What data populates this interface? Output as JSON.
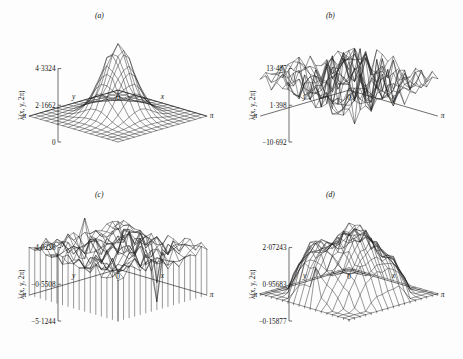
{
  "figure": {
    "background_color": "#fdfdfd",
    "line_color": "#1b1b1b",
    "panel_count": 4
  },
  "axis_common": {
    "vertical_label": "λ(x, y, 2π)",
    "x_axis_label": "x",
    "y_axis_label": "y",
    "origin_label": "0",
    "x_max_label": "π",
    "y_max_label": "π",
    "grid_divisions": 16
  },
  "panels": [
    {
      "tag": "(a)",
      "position": "top-left",
      "vertical_label": "λ(x, y, 2π)",
      "ticks": [
        "4·3324",
        "2·1662",
        "0"
      ],
      "x_label": "x",
      "y_label": "y",
      "origin_label": "0",
      "x_max_label": "π",
      "y_max_label": "π",
      "surface_description": "single smooth central peak with sharp narrow spikes at apex"
    },
    {
      "tag": "(b)",
      "position": "top-right",
      "vertical_label": "λ(x, y, 2π)",
      "ticks": [
        "13·487",
        "1·398",
        "−10·692"
      ],
      "x_label": "x",
      "y_label": "y",
      "origin_label": "0",
      "x_max_label": "π",
      "y_max_label": "π",
      "surface_description": "highly irregular noisy surface with one tall isolated spike near left"
    },
    {
      "tag": "(c)",
      "position": "bottom-left",
      "vertical_label": "λ(x, y, 2π)",
      "ticks": [
        "4·0228",
        "−0·5508",
        "−5·1244"
      ],
      "x_label": "x",
      "y_label": "y",
      "origin_label": "0",
      "x_max_label": "π",
      "y_max_label": "π",
      "surface_description": "rough plateau with sharp downward spikes at front and right edges"
    },
    {
      "tag": "(d)",
      "position": "bottom-right",
      "vertical_label": "λ(x, y, 2π)",
      "ticks": [
        "2·07243",
        "0·95683",
        "−0·15877"
      ],
      "x_label": "x",
      "y_label": "y",
      "origin_label": "0",
      "x_max_label": "π",
      "y_max_label": "π",
      "surface_description": "broad raised dome-like plateau with rippled rough top and steep sides"
    }
  ],
  "chart_data": {
    "type": "surface",
    "title": "",
    "panels": [
      {
        "tag": "(a)",
        "zlabel": "λ(x, y, 2π)",
        "xlabel": "x",
        "ylabel": "y",
        "xlim": [
          0,
          3.14159
        ],
        "ylim": [
          0,
          3.14159
        ],
        "zlim": [
          0,
          4.3324
        ],
        "ztick_values": [
          0,
          2.1662,
          4.3324
        ],
        "ztick_labels": [
          "0",
          "2·1662",
          "4·3324"
        ],
        "surface_type": "smooth-central-peak",
        "noise_amplitude": 0.06,
        "peak_height": 4.3324,
        "grid": 16
      },
      {
        "tag": "(b)",
        "zlabel": "λ(x, y, 2π)",
        "xlabel": "x",
        "ylabel": "y",
        "xlim": [
          0,
          3.14159
        ],
        "ylim": [
          0,
          3.14159
        ],
        "zlim": [
          -10.692,
          13.487
        ],
        "ztick_values": [
          -10.692,
          1.398,
          13.487
        ],
        "ztick_labels": [
          "−10·692",
          "1·398",
          "13·487"
        ],
        "surface_type": "random-rough",
        "noise_amplitude": 1.0,
        "peak_height": 13.487,
        "grid": 16
      },
      {
        "tag": "(c)",
        "zlabel": "λ(x, y, 2π)",
        "xlabel": "x",
        "ylabel": "y",
        "xlim": [
          0,
          3.14159
        ],
        "ylim": [
          0,
          3.14159
        ],
        "zlim": [
          -5.1244,
          4.0228
        ],
        "ztick_values": [
          -5.1244,
          -0.5508,
          4.0228
        ],
        "ztick_labels": [
          "−5·1244",
          "−0·5508",
          "4·0228"
        ],
        "surface_type": "rough-plateau-with-spikes",
        "noise_amplitude": 0.55,
        "peak_height": 4.0228,
        "grid": 16
      },
      {
        "tag": "(d)",
        "zlabel": "λ(x, y, 2π)",
        "xlabel": "x",
        "ylabel": "y",
        "xlim": [
          0,
          3.14159
        ],
        "ylim": [
          0,
          3.14159
        ],
        "zlim": [
          -0.15877,
          2.07243
        ],
        "ztick_values": [
          -0.15877,
          0.95683,
          2.07243
        ],
        "ztick_labels": [
          "−0·15877",
          "0·95683",
          "2·07243"
        ],
        "surface_type": "broad-dome-plateau",
        "noise_amplitude": 0.22,
        "peak_height": 2.07243,
        "grid": 16
      }
    ]
  }
}
